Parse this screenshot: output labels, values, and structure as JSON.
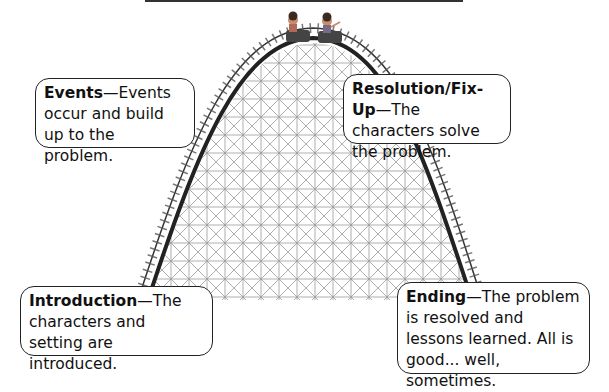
{
  "diagram": {
    "type": "plot-roller-coaster",
    "boxes": {
      "events": {
        "title": "Events",
        "text": "Events occur and build up to the problem."
      },
      "resolution": {
        "title": "Resolution/Fix-Up",
        "text": "The characters solve the problem."
      },
      "introduction": {
        "title": "Introduction",
        "text": "The characters and setting are introduced."
      },
      "ending": {
        "title": "Ending",
        "text": "The problem is resolved and lessons learned.  All is good... well, sometimes."
      }
    },
    "separator": "—",
    "illustration": "two children riding roller coaster cars at the top of the hill"
  }
}
